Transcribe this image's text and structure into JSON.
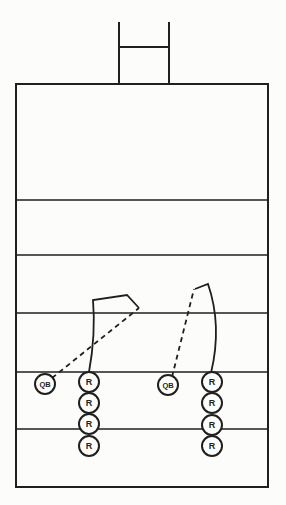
{
  "diagram": {
    "canvas": {
      "width": 286,
      "height": 505
    },
    "colors": {
      "ink": "#1f1f1f",
      "background": "#fcfcfb",
      "circle_fill": "#fdfdfc"
    },
    "field": {
      "x": 16,
      "y": 84,
      "width": 252,
      "height": 403,
      "yard_lines_y": [
        200,
        255,
        313,
        372,
        429
      ]
    },
    "goalpost": {
      "left_upright_x": 119,
      "right_upright_x": 169,
      "top_y": 23,
      "base_y": 84,
      "crossbar_y": 47
    },
    "routes": [
      {
        "name": "left-qb-dashed-path",
        "style": "dashed",
        "d": "M 52 378 L 139 308"
      },
      {
        "name": "left-receiver-route",
        "style": "solid",
        "d": "M 89 372 C 93 350 95 324 93 300 L 127 295 L 139 308"
      },
      {
        "name": "right-qb-dashed-path",
        "style": "dashed",
        "d": "M 172 377 L 194 289"
      },
      {
        "name": "right-receiver-route",
        "style": "solid",
        "d": "M 211 373 C 217 348 219 316 208 284 L 195 289"
      }
    ],
    "players": [
      {
        "name": "left-qb",
        "label": "QB",
        "x": 45,
        "y": 384,
        "r": 10,
        "font_size": 7.5
      },
      {
        "name": "left-receiver-1",
        "label": "R",
        "x": 89,
        "y": 382,
        "r": 10,
        "font_size": 9
      },
      {
        "name": "left-receiver-2",
        "label": "R",
        "x": 89,
        "y": 403,
        "r": 10,
        "font_size": 9
      },
      {
        "name": "left-receiver-3",
        "label": "R",
        "x": 89,
        "y": 424,
        "r": 10,
        "font_size": 9
      },
      {
        "name": "left-receiver-4",
        "label": "R",
        "x": 89,
        "y": 446,
        "r": 10,
        "font_size": 9
      },
      {
        "name": "right-qb",
        "label": "QB",
        "x": 168,
        "y": 385,
        "r": 10,
        "font_size": 7.5
      },
      {
        "name": "right-receiver-1",
        "label": "R",
        "x": 212,
        "y": 382,
        "r": 10,
        "font_size": 9
      },
      {
        "name": "right-receiver-2",
        "label": "R",
        "x": 212,
        "y": 403,
        "r": 10,
        "font_size": 9
      },
      {
        "name": "right-receiver-3",
        "label": "R",
        "x": 212,
        "y": 425,
        "r": 10,
        "font_size": 9
      },
      {
        "name": "right-receiver-4",
        "label": "R",
        "x": 212,
        "y": 446,
        "r": 10,
        "font_size": 9
      }
    ]
  }
}
